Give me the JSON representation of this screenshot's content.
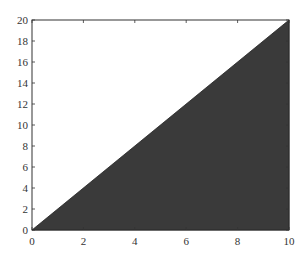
{
  "chart_data": {
    "type": "area",
    "title": "",
    "xlabel": "",
    "ylabel": "",
    "x": [
      0,
      10
    ],
    "series": [
      {
        "name": "y = 2x",
        "values": [
          0,
          20
        ],
        "fill": "#3a3a3a"
      }
    ],
    "xlim": [
      0,
      10
    ],
    "ylim": [
      0,
      20
    ],
    "xticks": [
      0,
      2,
      4,
      6,
      8,
      10
    ],
    "yticks": [
      0,
      2,
      4,
      6,
      8,
      10,
      12,
      14,
      16,
      18,
      20
    ],
    "grid": false,
    "legend": null
  },
  "labels": {
    "x": [
      "0",
      "2",
      "4",
      "6",
      "8",
      "10"
    ],
    "y": [
      "0",
      "2",
      "4",
      "6",
      "8",
      "10",
      "12",
      "14",
      "16",
      "18",
      "20"
    ]
  }
}
